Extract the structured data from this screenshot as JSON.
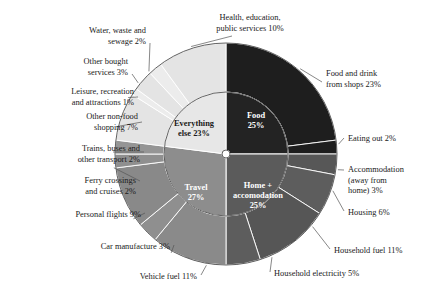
{
  "chart_data": {
    "type": "pie",
    "title": "",
    "subtitle": "",
    "layout": "nested-donut",
    "legend": "none",
    "center": {
      "x": 226,
      "y": 154
    },
    "radii": {
      "hole": 4,
      "inner_start": 27,
      "inner_end": 62,
      "outer_end": 111
    },
    "start_angle_deg": 0,
    "direction": "clockwise",
    "inner_ring": {
      "name": "Top-level categories",
      "categories": [
        "Food",
        "Home + accomodation",
        "Travel",
        "Everything else"
      ],
      "values": [
        25,
        25,
        27,
        23
      ],
      "labels": [
        "Food 25%",
        "Home + accomodation 25%",
        "Travel 27%",
        "Everything else 23%"
      ],
      "label_lines": [
        [
          "Food",
          "25%"
        ],
        [
          "Home +",
          "accomodation",
          "25%"
        ],
        [
          "Travel",
          "27%"
        ],
        [
          "Everything",
          "else 23%"
        ]
      ],
      "colors": [
        "#232323",
        "#5b5b5b",
        "#8d8d8d",
        "#e7e7e7"
      ],
      "text_colors": [
        "#ffffff",
        "#ffffff",
        "#ffffff",
        "#1a1a1a"
      ]
    },
    "outer_ring": {
      "name": "Subcategories",
      "categories": [
        "Food and drink from shops",
        "Eating out",
        "Accommodation (away from home)",
        "Housing",
        "Household fuel",
        "Household electricity",
        "Vehicle fuel",
        "Car manufacture",
        "Personal flights",
        "Ferry crossings and cruises",
        "Trains, buses and other transport",
        "Other non-food shopping",
        "Leisure, recreation and attractions",
        "Other bought services",
        "Water, waste and sewage",
        "Health, education, public services"
      ],
      "values": [
        23,
        2,
        3,
        6,
        11,
        5,
        11,
        3,
        9,
        2,
        2,
        7,
        1,
        3,
        2,
        10
      ],
      "labels": [
        "Food and drink from shops 23%",
        "Eating out 2%",
        "Accommodation (away from home) 3%",
        "Housing 6%",
        "Household fuel 11%",
        "Household electricity 5%",
        "Vehicle fuel 11%",
        "Car manufacture 3%",
        "Personal flights 9%",
        "Ferry crossings and cruises 2%",
        "Trains, buses and other transport 2%",
        "Other non-food shopping 7%",
        "Leisure, recreation and attractions 1%",
        "Other bought services 3%",
        "Water, waste and sewage 2%",
        "Health, education, public services 10%"
      ],
      "label_lines": [
        [
          "Food and drink",
          "from shops 23%"
        ],
        [
          "Eating out 2%"
        ],
        [
          "Accommodation",
          "(away from",
          "home) 3%"
        ],
        [
          "Housing 6%"
        ],
        [
          "Household fuel 11%"
        ],
        [
          "Household electricity 5%"
        ],
        [
          "Vehicle fuel 11%"
        ],
        [
          "Car manufacture 3%"
        ],
        [
          "Personal flights 9%"
        ],
        [
          "Ferry crossings",
          "and cruises 2%"
        ],
        [
          "Trains, buses and",
          "other transport 2%"
        ],
        [
          "Other non-food",
          "shopping 7%"
        ],
        [
          "Leisure, recreation",
          "and attractions 1%"
        ],
        [
          "Other bought",
          "services 3%"
        ],
        [
          "Water, waste and",
          "sewage 2%"
        ],
        [
          "Health, education,",
          "public services 10%"
        ]
      ],
      "parents": [
        "Food",
        "Food",
        "Home + accomodation",
        "Home + accomodation",
        "Home + accomodation",
        "Home + accomodation",
        "Travel",
        "Travel",
        "Travel",
        "Travel",
        "Travel",
        "Everything else",
        "Everything else",
        "Everything else",
        "Everything else",
        "Everything else"
      ],
      "colors": [
        "#1e1e1e",
        "#1e1e1e",
        "#575757",
        "#5d5d5d",
        "#565656",
        "#5d5d5d",
        "#8a8a8a",
        "#8f8f8f",
        "#898989",
        "#8f8f8f",
        "#959595",
        "#e4e4e4",
        "#ececec",
        "#e4e4e4",
        "#ececec",
        "#e4e4e4"
      ]
    }
  }
}
